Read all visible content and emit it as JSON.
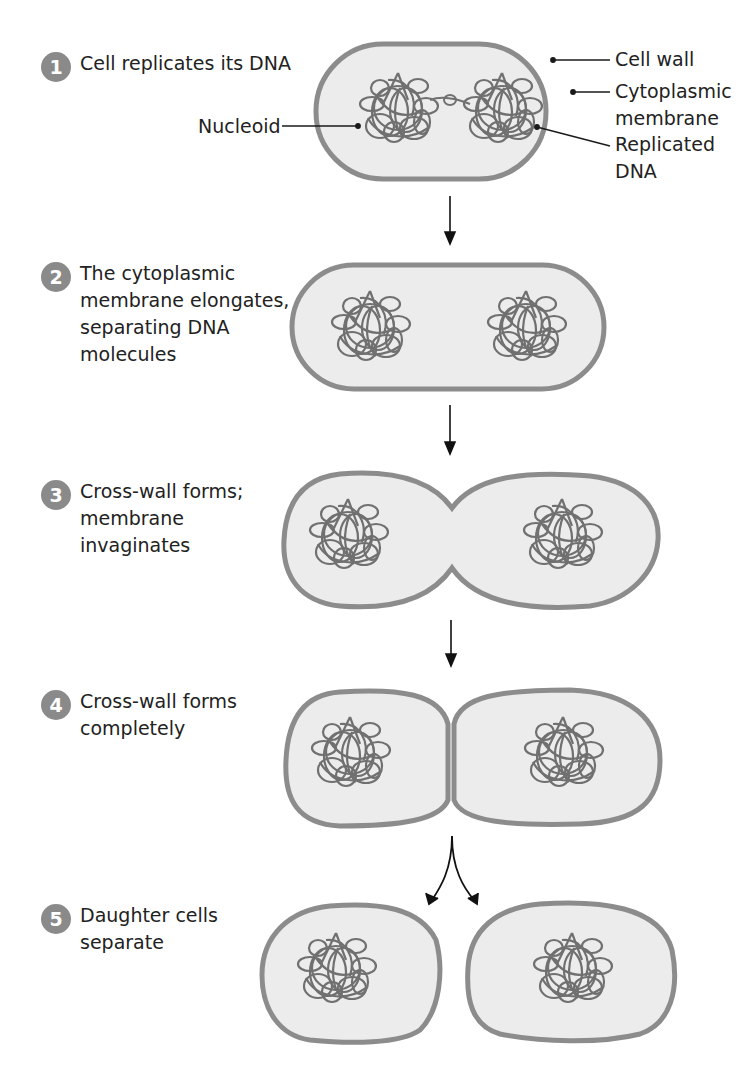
{
  "steps": [
    {
      "number": "1",
      "text": "Cell replicates its DNA"
    },
    {
      "number": "2",
      "text": "The cytoplasmic\nmembrane elongates,\nseparating DNA\nmolecules"
    },
    {
      "number": "3",
      "text": "Cross-wall forms;\nmembrane\ninvaginates"
    },
    {
      "number": "4",
      "text": "Cross-wall forms\ncompletely"
    },
    {
      "number": "5",
      "text": "Daughter cells\nseparate"
    }
  ],
  "labels": {
    "nucleoid": "Nucleoid",
    "cell_wall": "Cell wall",
    "cytoplasmic_membrane": "Cytoplasmic\nmembrane",
    "replicated_dna": "Replicated\nDNA"
  },
  "colors": {
    "badge": "#8a8a8a",
    "cell_wall": "#8c8c8c",
    "cytoplasm": "#ececec",
    "dna": "#6e6e6e",
    "leader": "#1a1a1a"
  }
}
